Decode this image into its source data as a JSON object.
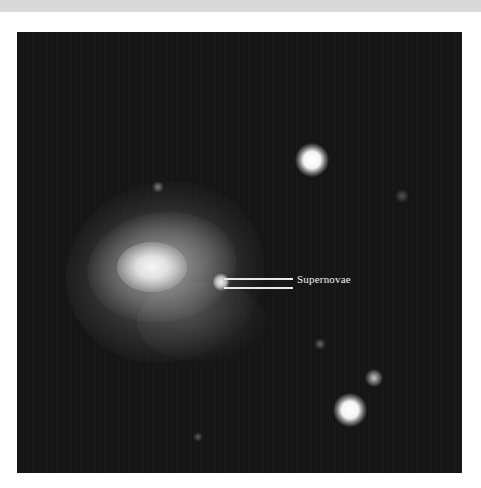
{
  "image": {
    "description": "Astronomical photograph of a spiral galaxy with a supernova and foreground stars",
    "background_color": "#151515",
    "annotation": {
      "label": "Supernovae",
      "color": "#f2f2f2"
    },
    "objects": [
      {
        "type": "galaxy",
        "x": 148,
        "y": 262
      },
      {
        "type": "supernova",
        "x": 221,
        "y": 282
      },
      {
        "type": "star",
        "x": 312,
        "y": 160,
        "size": 28,
        "brightness": "bright"
      },
      {
        "type": "star",
        "x": 402,
        "y": 196,
        "size": 12,
        "brightness": "faint"
      },
      {
        "type": "star",
        "x": 320,
        "y": 344,
        "size": 10,
        "brightness": "faint"
      },
      {
        "type": "star",
        "x": 374,
        "y": 378,
        "size": 14,
        "brightness": "medium"
      },
      {
        "type": "star",
        "x": 350,
        "y": 410,
        "size": 28,
        "brightness": "bright"
      },
      {
        "type": "star",
        "x": 198,
        "y": 437,
        "size": 8,
        "brightness": "faint"
      },
      {
        "type": "star",
        "x": 158,
        "y": 187,
        "size": 12,
        "brightness": "faint"
      }
    ]
  }
}
